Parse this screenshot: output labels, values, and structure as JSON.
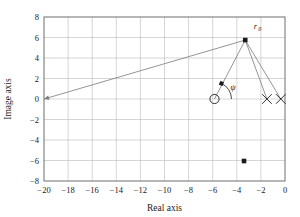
{
  "chart_data": {
    "type": "scatter",
    "title": "",
    "xlabel": "Real axis",
    "ylabel": "Image axis",
    "xlim": [
      -20,
      0
    ],
    "ylim": [
      -8,
      8
    ],
    "xticks": [
      -20,
      -18,
      -16,
      -14,
      -12,
      -10,
      -8,
      -6,
      -4,
      -2,
      0
    ],
    "xticklabels": [
      "-20",
      "-18",
      "-16",
      "-14",
      "-12",
      "-10",
      "-8",
      "-6",
      "-4",
      "-2",
      "0"
    ],
    "yticks": [
      -8,
      -6,
      -4,
      -2,
      0,
      2,
      4,
      6,
      8
    ],
    "yticklabels": [
      "-8",
      "-6",
      "-4",
      "-2",
      "0",
      "2",
      "4",
      "6",
      "8"
    ],
    "grid": true,
    "legend": "none",
    "series": [
      {
        "name": "design-point",
        "marker": "filled-square",
        "points": [
          {
            "x": -3.3,
            "y": 5.75
          }
        ],
        "label": "r0"
      },
      {
        "name": "open-loop-zero",
        "marker": "open-circle",
        "points": [
          {
            "x": -5.85,
            "y": 0.0
          }
        ]
      },
      {
        "name": "open-loop-poles",
        "marker": "cross",
        "points": [
          {
            "x": -1.5,
            "y": 0.0
          },
          {
            "x": -0.35,
            "y": 0.0
          }
        ]
      },
      {
        "name": "lower-point",
        "marker": "filled-square",
        "points": [
          {
            "x": -3.4,
            "y": -6.05
          }
        ]
      }
    ],
    "vectors": [
      {
        "name": "asymptote-ray",
        "from": {
          "x": -20,
          "y": 0.0
        },
        "to": {
          "x": -3.3,
          "y": 5.75
        },
        "arrow": "start"
      },
      {
        "name": "zero-vector",
        "from": {
          "x": -5.85,
          "y": 0.0
        },
        "to": {
          "x": -3.3,
          "y": 5.75
        },
        "arrow": "none"
      },
      {
        "name": "pole-vector-1",
        "from": {
          "x": -1.5,
          "y": 0.0
        },
        "to": {
          "x": -3.3,
          "y": 5.75
        },
        "arrow": "none"
      },
      {
        "name": "pole-vector-2",
        "from": {
          "x": -0.35,
          "y": 0.0
        },
        "to": {
          "x": -3.3,
          "y": 5.75
        },
        "arrow": "none"
      }
    ],
    "annotations": [
      {
        "name": "r0",
        "text": "r",
        "subscript": "0",
        "x": -2.6,
        "y": 6.85
      },
      {
        "name": "psi",
        "text": "ψ",
        "x": -4.55,
        "y": 0.85
      }
    ],
    "angle_arcs": [
      {
        "name": "psi-arc",
        "vertex": {
          "x": -5.85,
          "y": 0.0
        },
        "radius_px": 17,
        "start_deg": 0,
        "end_deg": 66
      }
    ],
    "colors": {
      "grid": "#b9b9b9",
      "frame": "#6e6e6e",
      "line": "#7a7a7a",
      "marker": "#1a1a1a",
      "text": "#1a1a1a",
      "background": "#ffffff"
    }
  }
}
